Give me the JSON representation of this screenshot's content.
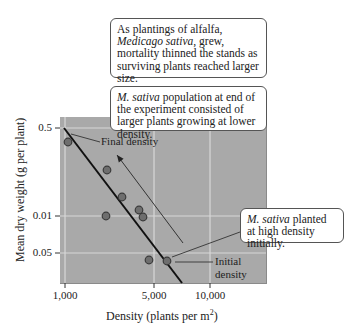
{
  "chart_data": {
    "type": "scatter",
    "title": "",
    "xlabel": "Density (plants per m²)",
    "ylabel": "Mean dry weight (g per plant)",
    "x_scale": "log",
    "x_ticks": [
      {
        "label": "1,000",
        "px": 65
      },
      {
        "label": "5,000",
        "px": 154
      },
      {
        "label": "10,000",
        "px": 210
      }
    ],
    "y_ticks": [
      {
        "label": "0.5",
        "py": 128
      },
      {
        "label": "0.01",
        "py": 216
      },
      {
        "label": "0.05",
        "py": 253
      }
    ],
    "grid": true,
    "series": [
      {
        "name": "Medicago sativa stands",
        "points": [
          {
            "x": 1030,
            "y": 0.42,
            "px": 68,
            "py": 142
          },
          {
            "x": 2900,
            "y": 0.26,
            "px": 107,
            "py": 170
          },
          {
            "x": 3560,
            "y": 0.13,
            "px": 122,
            "py": 197
          },
          {
            "x": 2840,
            "y": 0.01,
            "px": 106,
            "py": 216
          },
          {
            "x": 4300,
            "y": 0.012,
            "px": 139,
            "py": 210
          },
          {
            "x": 4500,
            "y": 0.011,
            "px": 143,
            "py": 217
          },
          {
            "x": 4800,
            "y": 0.06,
            "px": 149,
            "py": 260
          },
          {
            "x": 6800,
            "y": 0.06,
            "px": 167,
            "py": 261
          }
        ]
      }
    ],
    "fit_line": {
      "from_px": [
        64,
        128
      ],
      "to_px": [
        182,
        283
      ]
    },
    "arrow": {
      "from_px": [
        183,
        243
      ],
      "to_px": [
        117,
        155
      ],
      "meaning": "time / self-thinning direction"
    },
    "annotations": [
      "Final density",
      "Initial density"
    ]
  },
  "labels": {
    "final_density": "Final density",
    "initial_density_1": "Initial",
    "initial_density_2": "density",
    "xlabel_main": "Density (plants per m",
    "xlabel_sup": "2",
    "xlabel_close": ")",
    "ylabel": "Mean dry weight (g per plant)",
    "xticks": [
      "1,000",
      "5,000",
      "10,000"
    ],
    "yticks": [
      "0.5",
      "0.01",
      "0.05"
    ]
  },
  "callouts": {
    "top": {
      "t1": "As plantings of alfalfa, ",
      "t1_italic": "Medicago sativa",
      "t2": ", grew, mortality thinned the stands as surviving plants reached larger size."
    },
    "middle": {
      "italic": "M. sativa",
      "text": " population at end of the experiment consisted of larger plants growing at lower density."
    },
    "right": {
      "italic": "M. sativa",
      "text": " planted at high density initially."
    }
  },
  "colors": {
    "plot_bg": "#a9a9a9",
    "grid": "#d8d8d8",
    "point_fill": "#6e6e6e",
    "point_stroke": "#3a3a3a",
    "line": "#111111"
  }
}
